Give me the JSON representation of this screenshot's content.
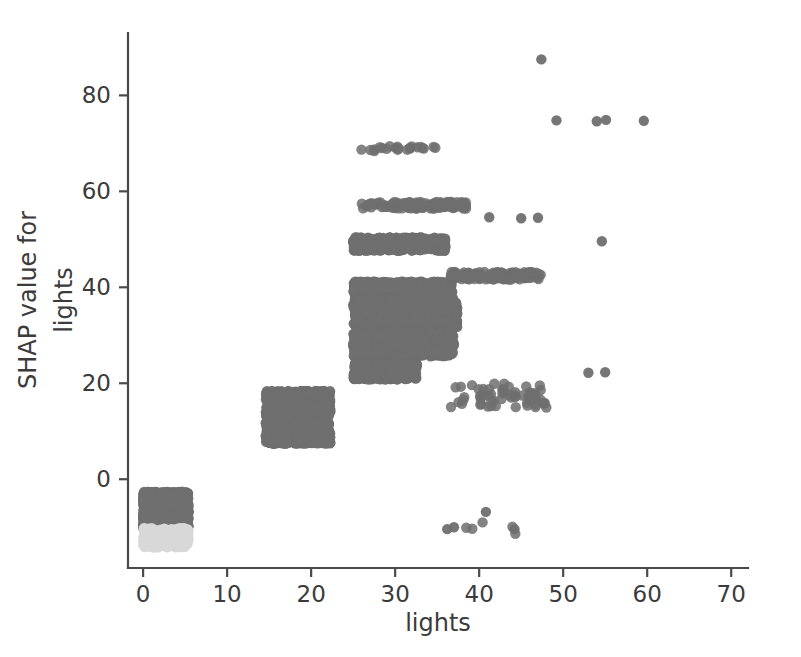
{
  "figure": {
    "background_color": "#ffffff",
    "width": 801,
    "height": 657
  },
  "chart_data": {
    "type": "scatter",
    "title": "",
    "xlabel": "lights",
    "ylabel": "SHAP value for\nlights",
    "ylabel_line1": "SHAP value for",
    "ylabel_line2": "lights",
    "xlim": [
      -1.8,
      72.0
    ],
    "ylim": [
      -18.5,
      93.0
    ],
    "xticks": [
      0,
      10,
      20,
      30,
      40,
      50,
      60,
      70
    ],
    "xticklabels": [
      "0",
      "10",
      "20",
      "30",
      "40",
      "50",
      "60",
      "70"
    ],
    "yticks": [
      0,
      20,
      40,
      60,
      80
    ],
    "yticklabels": [
      "0",
      "20",
      "40",
      "60",
      "80"
    ],
    "grid": false,
    "legend": null,
    "marker_color": "#6f6f6f",
    "marker_color_light": "#d8d8d8",
    "marker_size": 5.2,
    "marker_opacity": 0.85,
    "axis_color": "#4a4a4a",
    "text_color": "#3b3b3b",
    "clusters": [
      {
        "name": "zero-lights-negative-block",
        "x_range": [
          0.0,
          5.4
        ],
        "y_range": [
          -10.2,
          -2.6
        ],
        "n": 1500,
        "fill": "solid",
        "color": "#6f6f6f"
      },
      {
        "name": "zero-lights-light-strip",
        "x_range": [
          0.0,
          5.4
        ],
        "y_range": [
          -14.2,
          -10.2
        ],
        "n": 300,
        "fill": "solid",
        "color": "#d8d8d8"
      },
      {
        "name": "ten-lights-band-upper",
        "x_range": [
          14.6,
          22.3
        ],
        "y_range": [
          12.6,
          18.4
        ],
        "n": 620,
        "fill": "solid",
        "color": "#6f6f6f"
      },
      {
        "name": "ten-lights-band-lower",
        "x_range": [
          14.6,
          22.3
        ],
        "y_range": [
          7.4,
          12.0
        ],
        "n": 640,
        "fill": "solid",
        "color": "#6f6f6f"
      },
      {
        "name": "twenty-lights-band-48",
        "x_range": [
          25.0,
          36.0
        ],
        "y_range": [
          47.6,
          50.4
        ],
        "n": 420,
        "fill": "solid",
        "color": "#6f6f6f"
      },
      {
        "name": "twenty-lights-band-40",
        "x_range": [
          25.0,
          36.8
        ],
        "y_range": [
          38.6,
          41.2
        ],
        "n": 430,
        "fill": "solid",
        "color": "#6f6f6f"
      },
      {
        "name": "twenty-lights-core-35",
        "x_range": [
          25.0,
          37.4
        ],
        "y_range": [
          31.6,
          37.8
        ],
        "n": 900,
        "fill": "solid",
        "color": "#6f6f6f"
      },
      {
        "name": "twenty-lights-core-29",
        "x_range": [
          25.0,
          37.0
        ],
        "y_range": [
          25.6,
          31.0
        ],
        "n": 880,
        "fill": "solid",
        "color": "#6f6f6f"
      },
      {
        "name": "twenty-lights-band-22",
        "x_range": [
          25.0,
          32.6
        ],
        "y_range": [
          20.8,
          24.2
        ],
        "n": 500,
        "fill": "solid",
        "color": "#6f6f6f"
      },
      {
        "name": "band-69",
        "x_range": [
          25.6,
          35.2
        ],
        "y_range": [
          68.4,
          69.6
        ],
        "n": 22,
        "fill": "sparse",
        "color": "#6f6f6f"
      },
      {
        "name": "band-57",
        "x_range": [
          25.8,
          38.6
        ],
        "y_range": [
          56.4,
          57.8
        ],
        "n": 120,
        "fill": "dense-line",
        "color": "#6f6f6f"
      },
      {
        "name": "band-42-right",
        "x_range": [
          36.6,
          47.4
        ],
        "y_range": [
          41.6,
          43.2
        ],
        "n": 130,
        "fill": "dense-line",
        "color": "#6f6f6f"
      },
      {
        "name": "sparse-right-low",
        "x_range": [
          36.0,
          48.0
        ],
        "y_range": [
          14.8,
          20.0
        ],
        "n": 60,
        "fill": "scatter",
        "color": "#6f6f6f"
      },
      {
        "name": "negative-outliers",
        "x_range": [
          36.0,
          44.5
        ],
        "y_range": [
          -11.5,
          -6.5
        ],
        "n": 5,
        "fill": "scatter",
        "color": "#6f6f6f"
      }
    ],
    "notable_points": [
      {
        "x": 47.4,
        "y": 87.5,
        "label": "max-outlier"
      },
      {
        "x": 49.2,
        "y": 74.8,
        "label": "high-1"
      },
      {
        "x": 54.0,
        "y": 74.6,
        "label": "high-2"
      },
      {
        "x": 55.1,
        "y": 74.9,
        "label": "high-3"
      },
      {
        "x": 59.6,
        "y": 74.7,
        "label": "high-4"
      },
      {
        "x": 54.6,
        "y": 49.6,
        "label": "mid-right-1"
      },
      {
        "x": 41.2,
        "y": 54.6,
        "label": "mid-right-2"
      },
      {
        "x": 45.0,
        "y": 54.4,
        "label": "mid-right-3"
      },
      {
        "x": 47.0,
        "y": 54.5,
        "label": "mid-right-4"
      },
      {
        "x": 53.0,
        "y": 22.2,
        "label": "low-right-1"
      },
      {
        "x": 55.0,
        "y": 22.3,
        "label": "low-right-2"
      },
      {
        "x": 36.2,
        "y": -10.4,
        "label": "neg-1"
      },
      {
        "x": 37.0,
        "y": -10.0,
        "label": "neg-2"
      },
      {
        "x": 40.8,
        "y": -6.8,
        "label": "neg-3"
      },
      {
        "x": 44.2,
        "y": -10.4,
        "label": "neg-4"
      }
    ]
  }
}
